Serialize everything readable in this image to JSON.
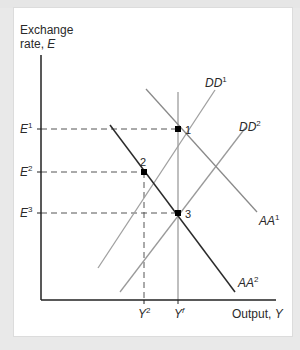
{
  "figure": {
    "y_axis_label_line1": "Exchange",
    "y_axis_label_line2": "rate, ",
    "y_axis_label_var": "E",
    "x_axis_label": "Output, ",
    "x_axis_label_var": "Y"
  },
  "y_ticks": [
    {
      "base": "E",
      "sup": "1"
    },
    {
      "base": "E",
      "sup": "2"
    },
    {
      "base": "E",
      "sup": "3"
    }
  ],
  "x_ticks": [
    {
      "base": "Y",
      "sup": "2"
    },
    {
      "base": "Y",
      "sup": "f"
    }
  ],
  "curves": {
    "DD1": {
      "base": "DD",
      "sup": "1",
      "color": "#9a9a9a"
    },
    "DD2": {
      "base": "DD",
      "sup": "2",
      "color": "#9a9a9a"
    },
    "AA1": {
      "base": "AA",
      "sup": "1",
      "color": "#8a8a8a"
    },
    "AA2": {
      "base": "AA",
      "sup": "2",
      "color": "#2b2b2b"
    }
  },
  "points": [
    {
      "label": "1"
    },
    {
      "label": "2"
    },
    {
      "label": "3"
    }
  ],
  "colors": {
    "axis": "#222222",
    "dashed": "#555555",
    "point": "#000000",
    "background": "#e9e9e9",
    "panel": "#ffffff"
  }
}
